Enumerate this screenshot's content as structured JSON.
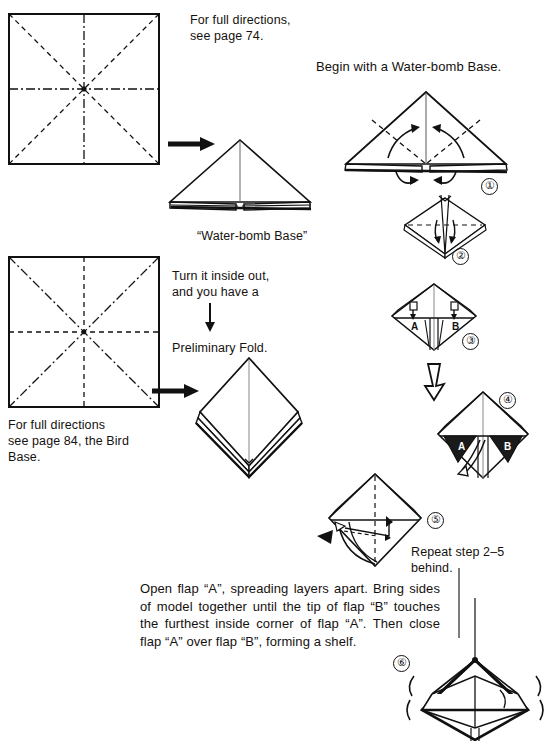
{
  "page": {
    "width": 547,
    "height": 741,
    "background": "#ffffff",
    "ink": "#111111"
  },
  "left_column": {
    "note_top": "For full directions,\nsee page 74.",
    "caption_waterbomb": "“Water-bomb Base”",
    "note_turn_inside_out": "Turn it inside out,\nand you have a",
    "label_preliminary": "Preliminary Fold.",
    "note_bird_base": "For full directions\nsee page 84, the Bird\nBase."
  },
  "right_column": {
    "heading": "Begin with a Water-bomb Base.",
    "repeat_note": "Repeat step 2–5 behind."
  },
  "body_text": "Open flap “A”, spreading layers apart. Bring sides of model together until the tip of flap “B” touches the furthest inside corner of flap “A”. Then close flap “A” over flap “B”, forming a shelf.",
  "steps": [
    {
      "number": "①",
      "name": "waterbomb-base-with-fold-arrows"
    },
    {
      "number": "②",
      "name": "diamond-valley-fold"
    },
    {
      "number": "③",
      "name": "diamond-flaps-ab-push"
    },
    {
      "number": "④",
      "name": "diamond-flaps-ab-filled"
    },
    {
      "number": "⑤",
      "name": "diamond-open-flap-a"
    },
    {
      "number": "⑥",
      "name": "finished-lantern-shape"
    }
  ],
  "flap_labels": {
    "a": "A",
    "b": "B"
  },
  "figures": {
    "square_top": {
      "name": "crease-pattern-square-waterbomb"
    },
    "square_bottom": {
      "name": "crease-pattern-square-bird"
    },
    "triangle": {
      "name": "water-bomb-base-triangle"
    },
    "diamond": {
      "name": "preliminary-fold-diamond"
    }
  }
}
